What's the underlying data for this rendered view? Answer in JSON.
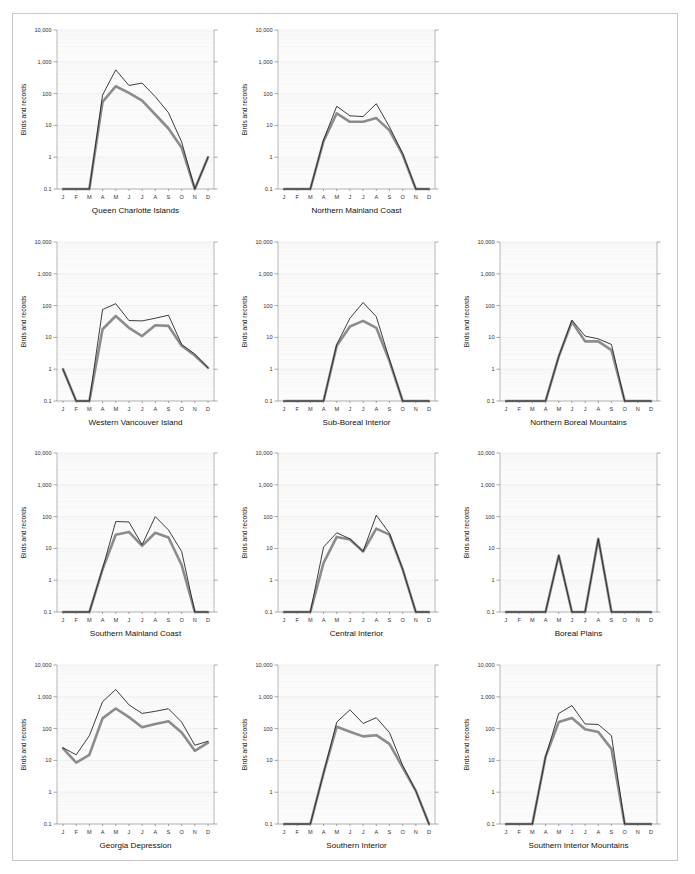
{
  "figure": {
    "y_axis_label": "Birds and records",
    "y_ticks": [
      "10,000",
      "1,000",
      "100",
      "10",
      "1",
      "0.1"
    ],
    "y_values": [
      10000,
      1000,
      100,
      10,
      1,
      0.1
    ],
    "months": [
      "J",
      "F",
      "M",
      "A",
      "M",
      "J",
      "J",
      "A",
      "S",
      "O",
      "N",
      "D"
    ],
    "series_names": [
      "Records",
      "Birds"
    ],
    "colors": {
      "records": "#1c1c1c",
      "birds": "#8c8c8c",
      "plot_background": "#fbfbfb",
      "grid": "#ededed",
      "axis": "#8a8a8a",
      "border": "#c9c9c9"
    },
    "layout": {
      "rows": 4,
      "cols": 3,
      "empty_cells": [
        "row1-col3"
      ]
    }
  },
  "chart_data": [
    {
      "type": "line",
      "title": "Queen Charlotte Islands",
      "xlabel": "",
      "ylabel": "Birds and records",
      "categories": [
        "J",
        "F",
        "M",
        "A",
        "M",
        "J",
        "J",
        "A",
        "S",
        "O",
        "N",
        "D"
      ],
      "ylim": [
        0.1,
        10000
      ],
      "yscale": "log",
      "grid": true,
      "legend": "none",
      "series": [
        {
          "name": "Records",
          "values": [
            0.1,
            0.1,
            0.1,
            90,
            560,
            180,
            215,
            80,
            25,
            3,
            0.1,
            1
          ]
        },
        {
          "name": "Birds",
          "values": [
            0.1,
            0.1,
            0.1,
            55,
            170,
            105,
            60,
            22,
            8,
            2,
            0.1,
            1
          ]
        }
      ]
    },
    {
      "type": "line",
      "title": "Northern Mainland Coast",
      "xlabel": "",
      "ylabel": "Birds and records",
      "categories": [
        "J",
        "F",
        "M",
        "A",
        "M",
        "J",
        "J",
        "A",
        "S",
        "O",
        "N",
        "D"
      ],
      "ylim": [
        0.1,
        10000
      ],
      "yscale": "log",
      "grid": true,
      "legend": "none",
      "series": [
        {
          "name": "Records",
          "values": [
            0.1,
            0.1,
            0.1,
            3.5,
            40,
            20,
            19,
            48,
            9,
            1.3,
            0.1,
            0.1
          ]
        },
        {
          "name": "Birds",
          "values": [
            0.1,
            0.1,
            0.1,
            3.2,
            24,
            13,
            13,
            17,
            7,
            1.2,
            0.1,
            0.1
          ]
        }
      ]
    },
    {
      "type": "line",
      "title": "Western Vancouver Island",
      "xlabel": "",
      "ylabel": "Birds and records",
      "categories": [
        "J",
        "F",
        "M",
        "A",
        "M",
        "J",
        "J",
        "A",
        "S",
        "O",
        "N",
        "D"
      ],
      "ylim": [
        0.1,
        10000
      ],
      "yscale": "log",
      "grid": true,
      "legend": "none",
      "series": [
        {
          "name": "Records",
          "values": [
            1,
            0.1,
            0.1,
            75,
            115,
            34,
            33,
            40,
            50,
            6,
            3,
            1.1
          ]
        },
        {
          "name": "Birds",
          "values": [
            1,
            0.1,
            0.1,
            18,
            47,
            20,
            11,
            24,
            23,
            5.5,
            2.7,
            1.1
          ]
        }
      ]
    },
    {
      "type": "line",
      "title": "Sub-Boreal Interior",
      "xlabel": "",
      "ylabel": "Birds and records",
      "categories": [
        "J",
        "F",
        "M",
        "A",
        "M",
        "J",
        "J",
        "A",
        "S",
        "O",
        "N",
        "D"
      ],
      "ylim": [
        0.1,
        10000
      ],
      "yscale": "log",
      "grid": true,
      "legend": "none",
      "series": [
        {
          "name": "Records",
          "values": [
            0.1,
            0.1,
            0.1,
            0.1,
            6,
            40,
            125,
            45,
            2,
            0.1,
            0.1,
            0.1
          ]
        },
        {
          "name": "Birds",
          "values": [
            0.1,
            0.1,
            0.1,
            0.1,
            5.5,
            22,
            33,
            20,
            1.8,
            0.1,
            0.1,
            0.1
          ]
        }
      ]
    },
    {
      "type": "line",
      "title": "Northern Boreal Mountains",
      "xlabel": "",
      "ylabel": "Birds and records",
      "categories": [
        "J",
        "F",
        "M",
        "A",
        "M",
        "J",
        "J",
        "A",
        "S",
        "O",
        "N",
        "D"
      ],
      "ylim": [
        0.1,
        10000
      ],
      "yscale": "log",
      "grid": true,
      "legend": "none",
      "series": [
        {
          "name": "Records",
          "values": [
            0.1,
            0.1,
            0.1,
            0.1,
            2.5,
            35,
            11,
            9,
            6,
            0.1,
            0.1,
            0.1
          ]
        },
        {
          "name": "Birds",
          "values": [
            0.1,
            0.1,
            0.1,
            0.1,
            2.5,
            31,
            7.5,
            7.5,
            4,
            0.1,
            0.1,
            0.1
          ]
        }
      ]
    },
    {
      "type": "line",
      "title": "Southern Mainland Coast",
      "xlabel": "",
      "ylabel": "Birds and records",
      "categories": [
        "J",
        "F",
        "M",
        "A",
        "M",
        "J",
        "J",
        "A",
        "S",
        "O",
        "N",
        "D"
      ],
      "ylim": [
        0.1,
        10000
      ],
      "yscale": "log",
      "grid": true,
      "legend": "none",
      "series": [
        {
          "name": "Records",
          "values": [
            0.1,
            0.1,
            0.1,
            2.3,
            70,
            68,
            13,
            100,
            38,
            8,
            0.1,
            0.1
          ]
        },
        {
          "name": "Birds",
          "values": [
            0.1,
            0.1,
            0.1,
            2.2,
            27,
            33,
            12,
            31,
            22,
            3,
            0.1,
            0.1
          ]
        }
      ]
    },
    {
      "type": "line",
      "title": "Central Interior",
      "xlabel": "",
      "ylabel": "Birds and records",
      "categories": [
        "J",
        "F",
        "M",
        "A",
        "M",
        "J",
        "J",
        "A",
        "S",
        "O",
        "N",
        "D"
      ],
      "ylim": [
        0.1,
        10000
      ],
      "yscale": "log",
      "grid": true,
      "legend": "none",
      "series": [
        {
          "name": "Records",
          "values": [
            0.1,
            0.1,
            0.1,
            11,
            31,
            20,
            8,
            110,
            30,
            2.2,
            0.1,
            0.1
          ]
        },
        {
          "name": "Birds",
          "values": [
            0.1,
            0.1,
            0.1,
            3.5,
            23,
            19,
            8,
            42,
            27,
            2.2,
            0.1,
            0.1
          ]
        }
      ]
    },
    {
      "type": "line",
      "title": "Boreal Plains",
      "xlabel": "",
      "ylabel": "Birds and records",
      "categories": [
        "J",
        "F",
        "M",
        "A",
        "M",
        "J",
        "J",
        "A",
        "S",
        "O",
        "N",
        "D"
      ],
      "ylim": [
        0.1,
        10000
      ],
      "yscale": "log",
      "grid": true,
      "legend": "none",
      "series": [
        {
          "name": "Records",
          "values": [
            0.1,
            0.1,
            0.1,
            0.1,
            6,
            0.1,
            0.1,
            20,
            0.1,
            0.1,
            0.1,
            0.1
          ]
        },
        {
          "name": "Birds",
          "values": [
            0.1,
            0.1,
            0.1,
            0.1,
            6,
            0.1,
            0.1,
            20,
            0.1,
            0.1,
            0.1,
            0.1
          ]
        }
      ]
    },
    {
      "type": "line",
      "title": "Georgia Depression",
      "xlabel": "",
      "ylabel": "Birds and records",
      "categories": [
        "J",
        "F",
        "M",
        "A",
        "M",
        "J",
        "J",
        "A",
        "S",
        "O",
        "N",
        "D"
      ],
      "ylim": [
        0.1,
        10000
      ],
      "yscale": "log",
      "grid": true,
      "legend": "none",
      "series": [
        {
          "name": "Records",
          "values": [
            25,
            15,
            60,
            700,
            1700,
            560,
            300,
            350,
            420,
            160,
            30,
            40
          ]
        },
        {
          "name": "Birds",
          "values": [
            24,
            8.5,
            15,
            210,
            430,
            230,
            110,
            140,
            170,
            75,
            20,
            36
          ]
        }
      ]
    },
    {
      "type": "line",
      "title": "Southern Interior",
      "xlabel": "",
      "ylabel": "Birds and records",
      "categories": [
        "J",
        "F",
        "M",
        "A",
        "M",
        "J",
        "J",
        "A",
        "S",
        "O",
        "N",
        "D"
      ],
      "ylim": [
        0.1,
        10000
      ],
      "yscale": "log",
      "grid": true,
      "legend": "none",
      "series": [
        {
          "name": "Records",
          "values": [
            0.1,
            0.1,
            0.1,
            4,
            160,
            390,
            145,
            220,
            75,
            7,
            1.1,
            0.1
          ]
        },
        {
          "name": "Birds",
          "values": [
            0.1,
            0.1,
            0.1,
            4,
            115,
            80,
            57,
            62,
            33,
            6,
            1.1,
            0.1
          ]
        }
      ]
    },
    {
      "type": "line",
      "title": "Southern Interior Mountains",
      "xlabel": "",
      "ylabel": "Birds and records",
      "categories": [
        "J",
        "F",
        "M",
        "A",
        "M",
        "J",
        "J",
        "A",
        "S",
        "O",
        "N",
        "D"
      ],
      "ylim": [
        0.1,
        10000
      ],
      "yscale": "log",
      "grid": true,
      "legend": "none",
      "series": [
        {
          "name": "Records",
          "values": [
            0.1,
            0.1,
            0.1,
            13,
            300,
            530,
            140,
            135,
            60,
            0.1,
            0.1,
            0.1
          ]
        },
        {
          "name": "Birds",
          "values": [
            0.1,
            0.1,
            0.1,
            13,
            160,
            215,
            95,
            78,
            23,
            0.1,
            0.1,
            0.1
          ]
        }
      ]
    }
  ]
}
